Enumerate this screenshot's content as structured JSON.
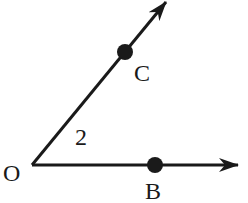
{
  "diagram": {
    "type": "angle",
    "stroke_color": "#1a1a1a",
    "background": "#ffffff",
    "vertex": {
      "label": "O",
      "x": 32,
      "y": 165
    },
    "angle_label": "2",
    "rays": [
      {
        "name": "OB",
        "from": "O",
        "to_x": 238,
        "to_y": 165,
        "point": {
          "label": "B",
          "x": 155,
          "y": 165
        }
      },
      {
        "name": "OC",
        "from": "O",
        "to_x": 166,
        "to_y": 2,
        "point": {
          "label": "C",
          "x": 125,
          "y": 52
        }
      }
    ]
  }
}
